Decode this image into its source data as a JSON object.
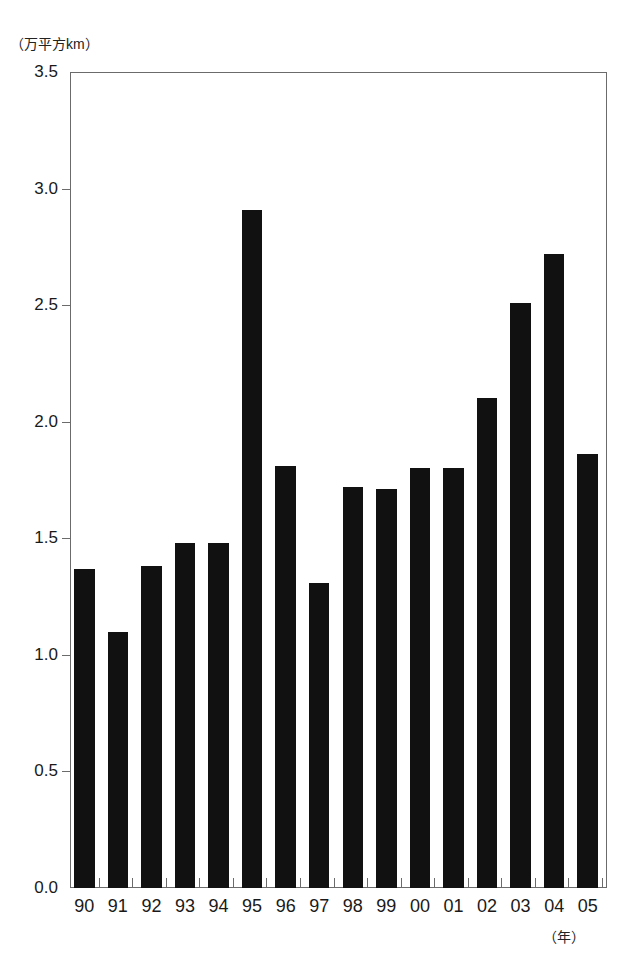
{
  "chart_data": {
    "type": "bar",
    "title": "",
    "xlabel": "（年）",
    "ylabel": "（万平方km）",
    "categories": [
      "90",
      "91",
      "92",
      "93",
      "94",
      "95",
      "96",
      "97",
      "98",
      "99",
      "00",
      "01",
      "02",
      "03",
      "04",
      "05"
    ],
    "values": [
      1.37,
      1.1,
      1.38,
      1.48,
      1.48,
      2.91,
      1.81,
      1.31,
      1.72,
      1.71,
      1.8,
      1.8,
      2.1,
      2.51,
      2.72,
      1.86
    ],
    "ylim": [
      0.0,
      3.5
    ],
    "ytick_labels": [
      "0.0",
      "0.5",
      "1.0",
      "1.5",
      "2.0",
      "2.5",
      "3.0",
      "3.5"
    ],
    "ytick_values": [
      0.0,
      0.5,
      1.0,
      1.5,
      2.0,
      2.5,
      3.0,
      3.5
    ],
    "grid": false,
    "legend": null,
    "bar_color": "#111111",
    "axis_color": "#6b6b6b",
    "background_color": "#ffffff"
  },
  "axes": {
    "y_unit_caption": "（万平方km）",
    "x_unit_caption": "（年）"
  },
  "title": {
    "text": ""
  }
}
